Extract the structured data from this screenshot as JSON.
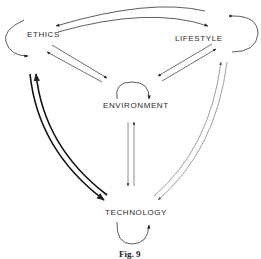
{
  "figure": {
    "caption": "Fig. 9",
    "nodes": {
      "ethics": "ETHICS",
      "lifestyle": "LIFESTYLE",
      "environment": "ENVIRONMENT",
      "technology": "TECHNOLOGY"
    },
    "edges": [
      {
        "from": "LIFESTYLE",
        "to": "ETHICS",
        "style": "thin"
      },
      {
        "from": "ETHICS",
        "to": "LIFESTYLE",
        "style": "thin"
      },
      {
        "from": "ETHICS",
        "to": "ENVIRONMENT",
        "style": "thin"
      },
      {
        "from": "ENVIRONMENT",
        "to": "ETHICS",
        "style": "thin"
      },
      {
        "from": "LIFESTYLE",
        "to": "ENVIRONMENT",
        "style": "thin"
      },
      {
        "from": "ENVIRONMENT",
        "to": "LIFESTYLE",
        "style": "thin"
      },
      {
        "from": "ENVIRONMENT",
        "to": "TECHNOLOGY",
        "style": "thin"
      },
      {
        "from": "TECHNOLOGY",
        "to": "ENVIRONMENT",
        "style": "thin"
      },
      {
        "from": "ETHICS",
        "to": "TECHNOLOGY",
        "style": "thick"
      },
      {
        "from": "TECHNOLOGY",
        "to": "ETHICS",
        "style": "thick"
      },
      {
        "from": "LIFESTYLE",
        "to": "TECHNOLOGY",
        "style": "light"
      },
      {
        "from": "TECHNOLOGY",
        "to": "LIFESTYLE",
        "style": "light"
      }
    ],
    "self_loops": [
      "ETHICS",
      "LIFESTYLE",
      "ENVIRONMENT",
      "TECHNOLOGY"
    ]
  }
}
